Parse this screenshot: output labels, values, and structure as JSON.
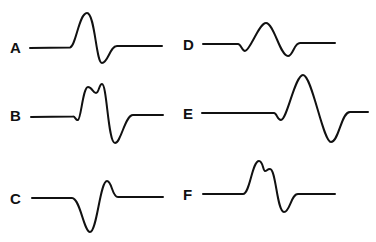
{
  "figure": {
    "panels": [
      {
        "id": "A",
        "label": "A",
        "description": "biphasic: positive peak then negative trough"
      },
      {
        "id": "B",
        "label": "B",
        "description": "small initial dip, notched double positive peak, then negative trough"
      },
      {
        "id": "C",
        "label": "C",
        "description": "negative trough then small positive peak"
      },
      {
        "id": "D",
        "label": "D",
        "description": "small initial dip, positive peak, negative trough"
      },
      {
        "id": "E",
        "label": "E",
        "description": "small initial dip, large positive peak, large negative trough"
      },
      {
        "id": "F",
        "label": "F",
        "description": "notched double positive peak then negative trough"
      }
    ],
    "stroke_color": "#111111",
    "background": "#ffffff"
  }
}
